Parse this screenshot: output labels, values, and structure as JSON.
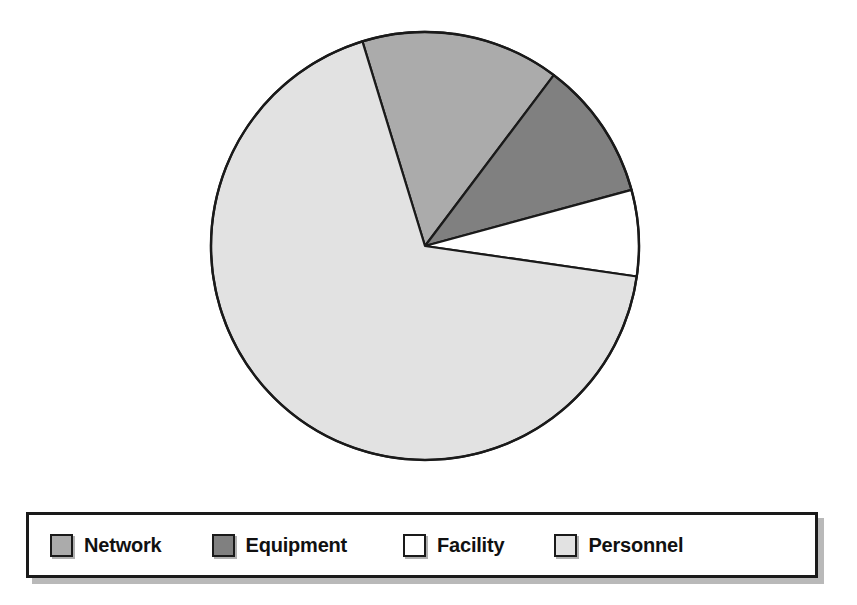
{
  "chart_data": {
    "type": "pie",
    "title": "",
    "subtitle": "",
    "xlabel": "",
    "ylabel": "",
    "grid": false,
    "legend_position": "bottom",
    "start_angle_deg": -17,
    "direction": "clockwise",
    "categories": [
      "Network",
      "Equipment",
      "Facility",
      "Personnel"
    ],
    "values": [
      15,
      10.5,
      6.5,
      68
    ],
    "units": "percent",
    "slices": [
      {
        "label": "Network",
        "value": 15,
        "percent": 15,
        "color": "#ababab",
        "start_angle_deg": 227,
        "end_angle_deg": 281
      },
      {
        "label": "Equipment",
        "value": 10.5,
        "percent": 10.5,
        "color": "#808080",
        "start_angle_deg": 281,
        "end_angle_deg": 319
      },
      {
        "label": "Facility",
        "value": 6.5,
        "percent": 6.5,
        "color": "#ffffff",
        "start_angle_deg": 319,
        "end_angle_deg": 343
      },
      {
        "label": "Personnel",
        "value": 68,
        "percent": 68,
        "color": "#e2e2e2",
        "start_angle_deg": 343,
        "end_angle_deg": 587
      }
    ],
    "stroke_color": "#1a1a1a",
    "background": "#ffffff"
  },
  "legend": {
    "box_border_color": "#1a1a1a",
    "background": "#ffffff",
    "items": [
      {
        "label": "Network",
        "color": "#ababab"
      },
      {
        "label": "Equipment",
        "color": "#808080"
      },
      {
        "label": "Facility",
        "color": "#ffffff"
      },
      {
        "label": "Personnel",
        "color": "#e2e2e2"
      }
    ]
  }
}
